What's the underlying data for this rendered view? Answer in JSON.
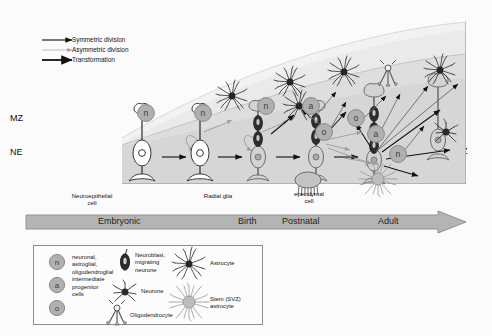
{
  "figure": {
    "zone_labels_left": [
      {
        "text": "MZ",
        "x": 4,
        "y": 118
      },
      {
        "text": "NE",
        "x": 4,
        "y": 152
      }
    ],
    "zone_labels_right": [
      {
        "text": "MZ",
        "x": 452,
        "y": 16
      },
      {
        "text": "MA",
        "x": 452,
        "y": 90
      },
      {
        "text": "SVZ",
        "x": 450,
        "y": 150
      },
      {
        "text": "VZ",
        "x": 452,
        "y": 172
      }
    ],
    "key": {
      "items": [
        {
          "label": "Symmetric division",
          "style": "solid-black"
        },
        {
          "label": "Asymmetric division",
          "style": "thin-grey"
        },
        {
          "label": "Transformation",
          "style": "thick-black"
        }
      ]
    },
    "stage_labels": [
      {
        "text": "Neuroepithelial\ncell",
        "x": 47,
        "y": 192
      },
      {
        "text": "Radial glia",
        "x": 176,
        "y": 192
      },
      {
        "text": "ependymal\ncell",
        "x": 279,
        "y": 192
      }
    ],
    "timeline": {
      "stages": [
        {
          "label": "Embryonic",
          "x": 72
        },
        {
          "label": "Birth",
          "x": 212
        },
        {
          "label": "Postnatal",
          "x": 255
        },
        {
          "label": "Adult",
          "x": 351
        }
      ]
    },
    "legend": {
      "progenitor_circles": [
        "n",
        "a",
        "o"
      ],
      "progenitor_text": "neuronal,\nastroglial,\noligodendroglial\nintermediate\nprogenitor\ncells",
      "entries": [
        {
          "label": "Neuroblast,\nmigrating\nneurone",
          "icon": "neuroblast-icon"
        },
        {
          "label": "Neurone",
          "icon": "neurone-icon"
        },
        {
          "label": "Oligodendrocyte",
          "icon": "oligodendrocyte-icon"
        },
        {
          "label": "Astrocyte",
          "icon": "astrocyte-icon"
        },
        {
          "label": "Stem (SVZ)\nastrocyte",
          "icon": "stem-astrocyte-icon"
        }
      ]
    },
    "progenitors_in_diagram": [
      {
        "type": "n",
        "x": 146,
        "y": 113
      },
      {
        "type": "n",
        "x": 203,
        "y": 113
      },
      {
        "type": "n",
        "x": 257,
        "y": 104
      },
      {
        "type": "a",
        "x": 300,
        "y": 107
      },
      {
        "type": "o",
        "x": 313,
        "y": 128
      },
      {
        "type": "o",
        "x": 345,
        "y": 116
      },
      {
        "type": "a",
        "x": 364,
        "y": 129
      },
      {
        "type": "n",
        "x": 385,
        "y": 146
      }
    ],
    "colors": {
      "band_upper": "#f2f2f2",
      "band_mid": "#e3e3e3",
      "band_lower": "#d0d0d0",
      "cell_fill": "#d3d3d3",
      "cell_stroke": "#6b6b6b",
      "nucleus_dark": "#3b3b3b",
      "arrow_black": "#111111",
      "arrow_grey": "#9c9c9c",
      "timeline_fill": "#b4b4b4",
      "timeline_stroke": "#8a8a8a",
      "frame": "#8d8d8d"
    }
  }
}
